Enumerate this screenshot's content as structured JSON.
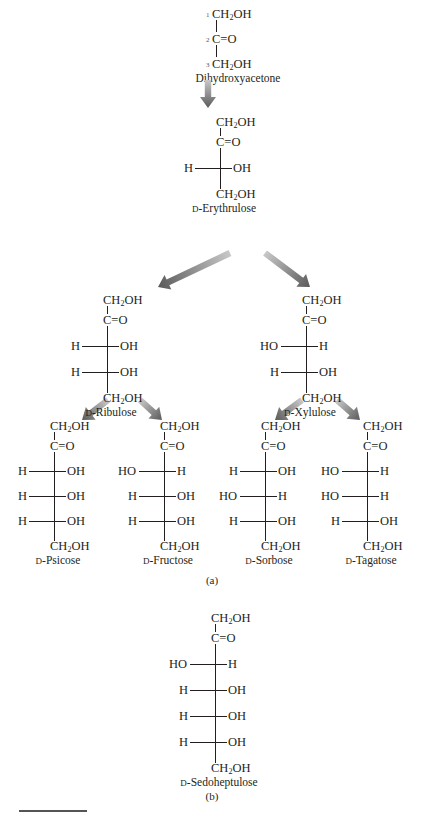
{
  "figure": {
    "part_a_label": "(a)",
    "part_b_label": "(b)",
    "arrow_color": "#5a5a5a",
    "arrow_fade_color": "#c8c8c8"
  },
  "molecules": {
    "dihydroxyacetone": {
      "name": "Dihydroxyacetone",
      "carbon_numbers": [
        "1",
        "2",
        "3"
      ],
      "top": "CH2OH",
      "carbonyl": "C=O",
      "bottom": "CH2OH"
    },
    "erythrulose": {
      "name_prefix": "D",
      "name": "-Erythrulose",
      "rows": [
        {
          "left": "H",
          "right": "OH"
        }
      ]
    },
    "ribulose": {
      "name_prefix": "D",
      "name": "-Ribulose",
      "rows": [
        {
          "left": "H",
          "right": "OH"
        },
        {
          "left": "H",
          "right": "OH"
        }
      ]
    },
    "xylulose": {
      "name_prefix": "D",
      "name": "-Xylulose",
      "rows": [
        {
          "left": "HO",
          "right": "H"
        },
        {
          "left": "H",
          "right": "OH"
        }
      ]
    },
    "psicose": {
      "name_prefix": "D",
      "name": "-Psicose",
      "rows": [
        {
          "left": "H",
          "right": "OH"
        },
        {
          "left": "H",
          "right": "OH"
        },
        {
          "left": "H",
          "right": "OH"
        }
      ]
    },
    "fructose": {
      "name_prefix": "D",
      "name": "-Fructose",
      "rows": [
        {
          "left": "HO",
          "right": "H"
        },
        {
          "left": "H",
          "right": "OH"
        },
        {
          "left": "H",
          "right": "OH"
        }
      ]
    },
    "sorbose": {
      "name_prefix": "D",
      "name": "-Sorbose",
      "rows": [
        {
          "left": "H",
          "right": "OH"
        },
        {
          "left": "HO",
          "right": "H"
        },
        {
          "left": "H",
          "right": "OH"
        }
      ]
    },
    "tagatose": {
      "name_prefix": "D",
      "name": "-Tagatose",
      "rows": [
        {
          "left": "HO",
          "right": "H"
        },
        {
          "left": "HO",
          "right": "H"
        },
        {
          "left": "H",
          "right": "OH"
        }
      ]
    },
    "sedoheptulose": {
      "name_prefix": "D",
      "name": "-Sedoheptulose",
      "rows": [
        {
          "left": "HO",
          "right": "H"
        },
        {
          "left": "H",
          "right": "OH"
        },
        {
          "left": "H",
          "right": "OH"
        },
        {
          "left": "H",
          "right": "OH"
        }
      ]
    }
  },
  "common": {
    "ch2oh_main": "CH",
    "ch2oh_sub": "2",
    "ch2oh_tail": "OH",
    "carbonyl": "C=O"
  }
}
